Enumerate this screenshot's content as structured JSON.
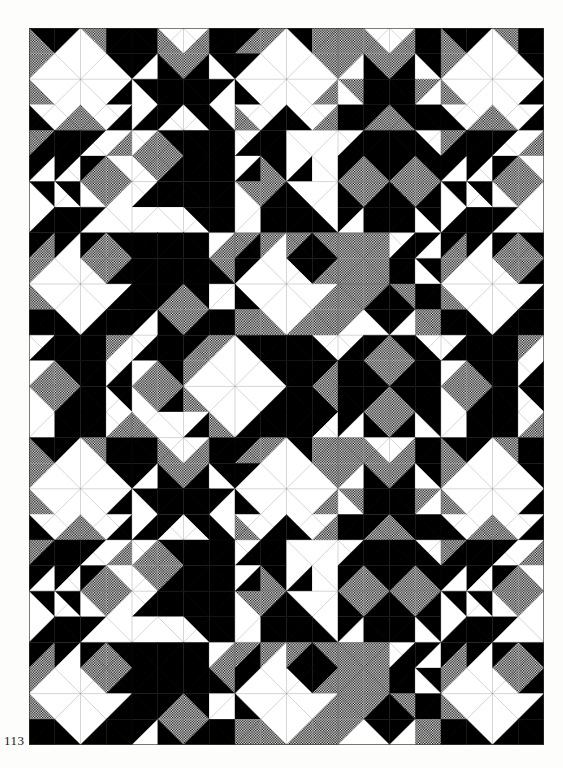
{
  "page": {
    "width": 563,
    "height": 768,
    "background": "#fdfdfc",
    "kind": "book-plate scan of a geometric mosaic pattern"
  },
  "page_number": "113",
  "page_number_pos": {
    "x": 4,
    "y": 733,
    "font_size": 13
  },
  "pattern": {
    "x": 29,
    "y": 28,
    "width": 515,
    "height": 717,
    "small_cols": 20,
    "small_rows": 28,
    "cell_w": 25.75,
    "cell_h": 25.6,
    "coarse_cell_w": 51.5,
    "coarse_cell_h": 51.2,
    "palette": {
      "black": "#000000",
      "white": "#ffffff",
      "gray_halftone_dark": "#000000",
      "gray_halftone_light": "#ffffff",
      "hairline": "#2a2a2a"
    },
    "legend": "Each token is one half-square-triangle unit. K=black W=white G=stippled gray. 'mXY'=split on main diagonal (X=upper-right, Y=lower-left). 'aXY'=split on anti diagonal (X=upper-left, Y=lower-right).",
    "block_period": 16,
    "block": [
      [
        "mKG",
        "aKW",
        "mGW",
        "K",
        "K",
        "mWG",
        "aWG",
        "K",
        "aKG",
        "aGW",
        "mKW",
        "G",
        "G",
        "mWG",
        "aWG",
        "K"
      ],
      [
        "aGW",
        "W",
        "W",
        "mKW",
        "aKW",
        "mGK",
        "aGK",
        "mKW",
        "aKW",
        "W",
        "W",
        "mGW",
        "aGW",
        "mGK",
        "aGK",
        "mKW"
      ],
      [
        "mWG",
        "W",
        "W",
        "aWK",
        "mKW",
        "K",
        "K",
        "aKW",
        "mWK",
        "W",
        "W",
        "aWG",
        "mGW",
        "K",
        "K",
        "aGW"
      ],
      [
        "mWK",
        "aWG",
        "mWG",
        "aWK",
        "aWK",
        "aKW",
        "mKW",
        "mWK",
        "mWG",
        "aWK",
        "mWK",
        "aWG",
        "K",
        "aKG",
        "mKG",
        "K"
      ],
      [
        "aGK",
        "K",
        "aKW",
        "aWG",
        "aWG",
        "mKG",
        "K",
        "K",
        "aWK",
        "K",
        "W",
        "W",
        "aWK",
        "K",
        "K",
        "mWK"
      ],
      [
        "aKW",
        "aKW",
        "aKG",
        "mWG",
        "mGW",
        "aGK",
        "K",
        "K",
        "aWK",
        "mKG",
        "aWK",
        "W",
        "aKG",
        "mKG",
        "aKG",
        "mKG"
      ],
      [
        "mKW",
        "mKW",
        "mGW",
        "aGW",
        "aWK",
        "K",
        "K",
        "K",
        "mGW",
        "aGK",
        "mWK",
        "W",
        "mGK",
        "aGK",
        "mGK",
        "aGK"
      ],
      [
        "aWK",
        "K",
        "aKW",
        "W",
        "W",
        "W",
        "mKW",
        "K",
        "W",
        "K",
        "K",
        "mWK",
        "aKW",
        "K",
        "K",
        "mKW"
      ],
      [
        "aKG",
        "aKW",
        "aKG",
        "mKG",
        "K",
        "K",
        "K",
        "aWG",
        "aGK",
        "aGW",
        "aGK",
        "mGK",
        "G",
        "G",
        "aWK",
        "aKW"
      ],
      [
        "aGW",
        "W",
        "mGW",
        "aGK",
        "K",
        "K",
        "K",
        "mGK",
        "aKW",
        "W",
        "mKW",
        "aKG",
        "G",
        "G",
        "K",
        "mKW"
      ],
      [
        "mWG",
        "W",
        "W",
        "aWK",
        "K",
        "aKG",
        "mKG",
        "W",
        "mWK",
        "W",
        "W",
        "aWG",
        "G",
        "aGK",
        "mGK",
        "K"
      ],
      [
        "K",
        "mWK",
        "aWK",
        "K",
        "aKW",
        "mGK",
        "aGK",
        "K",
        "G",
        "mWG",
        "aWG",
        "G",
        "aGW",
        "mKW",
        "aKW",
        "G"
      ],
      [
        "aWK",
        "K",
        "K",
        "aGW",
        "aWK",
        "K",
        "aKG",
        "aGW",
        "mKW",
        "K",
        "K",
        "mWK",
        "aWK",
        "aKG",
        "mKG",
        "mWK"
      ],
      [
        "aWG",
        "mKG",
        "K",
        "aWK",
        "aWG",
        "mKG",
        "aGW",
        "W",
        "W",
        "mKW",
        "K",
        "aKG",
        "K",
        "mGK",
        "aGK",
        "K"
      ],
      [
        "mGW",
        "aGK",
        "K",
        "mKW",
        "mGW",
        "aGK",
        "mWG",
        "W",
        "W",
        "aWK",
        "K",
        "mGK",
        "K",
        "aKG",
        "mKG",
        "K"
      ],
      [
        "W",
        "K",
        "K",
        "aWG",
        "mWG",
        "W",
        "aWK",
        "mWG",
        "aWK",
        "K",
        "K",
        "aKW",
        "aKW",
        "mGK",
        "aGK",
        "mKW"
      ]
    ]
  }
}
